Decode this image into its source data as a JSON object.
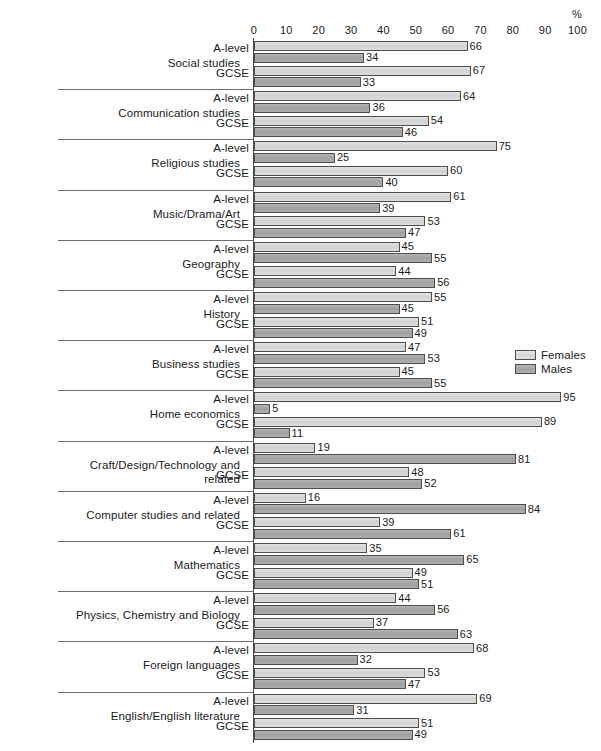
{
  "axis": {
    "percent_symbol": "%",
    "ticks": [
      0,
      10,
      20,
      30,
      40,
      50,
      60,
      70,
      80,
      90,
      100
    ],
    "tick_labels": [
      "0",
      "10",
      "20",
      "30",
      "40",
      "50",
      "60",
      "70",
      "80",
      "90",
      "100"
    ]
  },
  "legend": {
    "items": [
      {
        "label": "Females",
        "color": "#d2d2d2",
        "key": "females"
      },
      {
        "label": "Males",
        "color": "#a1a1a1",
        "key": "males"
      }
    ]
  },
  "qualifications": [
    "A-level",
    "GCSE"
  ],
  "chart_data": {
    "type": "bar",
    "orientation": "horizontal",
    "title": "",
    "subtitle": "",
    "xlabel": "%",
    "ylabel": "",
    "xlim": [
      0,
      100
    ],
    "grid": false,
    "legend_position": "middle-right",
    "group_labels": [
      "A-level",
      "GCSE"
    ],
    "series": [
      {
        "name": "Females",
        "color": "#d2d2d2"
      },
      {
        "name": "Males",
        "color": "#a1a1a1"
      }
    ],
    "categories": [
      "Social studies",
      "Communication studies",
      "Religious studies",
      "Music/Drama/Art",
      "Geography",
      "History",
      "Business studies",
      "Home economics",
      "Craft/Design/Technology and related",
      "Computer studies and related",
      "Mathematics",
      "Physics, Chemistry and Biology",
      "Foreign languages",
      "English/English literature"
    ],
    "data": [
      {
        "category": "Social studies",
        "A-level": {
          "Females": 66,
          "Males": 34
        },
        "GCSE": {
          "Females": 67,
          "Males": 33
        }
      },
      {
        "category": "Communication studies",
        "A-level": {
          "Females": 64,
          "Males": 36
        },
        "GCSE": {
          "Females": 54,
          "Males": 46
        }
      },
      {
        "category": "Religious studies",
        "A-level": {
          "Females": 75,
          "Males": 25
        },
        "GCSE": {
          "Females": 60,
          "Males": 40
        }
      },
      {
        "category": "Music/Drama/Art",
        "A-level": {
          "Females": 61,
          "Males": 39
        },
        "GCSE": {
          "Females": 53,
          "Males": 47
        }
      },
      {
        "category": "Geography",
        "A-level": {
          "Females": 45,
          "Males": 55
        },
        "GCSE": {
          "Females": 44,
          "Males": 56
        }
      },
      {
        "category": "History",
        "A-level": {
          "Females": 55,
          "Males": 45
        },
        "GCSE": {
          "Females": 51,
          "Males": 49
        }
      },
      {
        "category": "Business studies",
        "A-level": {
          "Females": 47,
          "Males": 53
        },
        "GCSE": {
          "Females": 45,
          "Males": 55
        }
      },
      {
        "category": "Home economics",
        "A-level": {
          "Females": 95,
          "Males": 5
        },
        "GCSE": {
          "Females": 89,
          "Males": 11
        }
      },
      {
        "category": "Craft/Design/Technology and related",
        "A-level": {
          "Females": 19,
          "Males": 81
        },
        "GCSE": {
          "Females": 48,
          "Males": 52
        }
      },
      {
        "category": "Computer studies and related",
        "A-level": {
          "Females": 16,
          "Males": 84
        },
        "GCSE": {
          "Females": 39,
          "Males": 61
        }
      },
      {
        "category": "Mathematics",
        "A-level": {
          "Females": 35,
          "Males": 65
        },
        "GCSE": {
          "Females": 49,
          "Males": 51
        }
      },
      {
        "category": "Physics, Chemistry and Biology",
        "A-level": {
          "Females": 44,
          "Males": 56
        },
        "GCSE": {
          "Females": 37,
          "Males": 63
        }
      },
      {
        "category": "Foreign languages",
        "A-level": {
          "Females": 68,
          "Males": 32
        },
        "GCSE": {
          "Females": 53,
          "Males": 47
        }
      },
      {
        "category": "English/English literature",
        "A-level": {
          "Females": 69,
          "Males": 31
        },
        "GCSE": {
          "Females": 51,
          "Males": 49
        }
      }
    ]
  }
}
